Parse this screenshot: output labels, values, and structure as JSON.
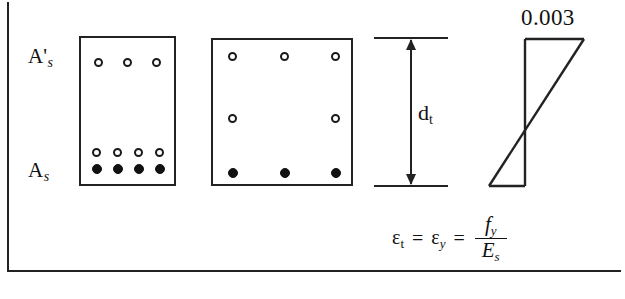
{
  "figure": {
    "labels": {
      "compression_steel": "A",
      "compression_steel_prime": "'",
      "compression_steel_sub": "s",
      "tension_steel": "A",
      "tension_steel_sub": "s",
      "depth_symbol": "d",
      "depth_sub": "t",
      "strain_max": "0.003"
    },
    "equation": {
      "eps_symbol": "ε",
      "eps_t_sub": "t",
      "equals_1": "=",
      "eps_y_sub": "y",
      "equals_2": "=",
      "numerator": "f",
      "numerator_sub": "y",
      "denominator": "E",
      "denominator_sub": "s"
    },
    "colors": {
      "line": "#222222",
      "bar_fill": "#111111",
      "background": "#ffffff"
    },
    "sections": [
      {
        "name": "section-left",
        "rows": [
          {
            "type": "open",
            "count": 3
          },
          {
            "type": "open",
            "count": 4
          },
          {
            "type": "filled",
            "count": 4
          }
        ]
      },
      {
        "name": "section-right",
        "rows": [
          {
            "type": "open",
            "count": 3
          },
          {
            "type": "open",
            "count": 2
          },
          {
            "type": "filled",
            "count": 3
          }
        ]
      }
    ],
    "strain_diagram": {
      "top_strain": "0.003",
      "shape": "bowtie",
      "neutral_axis_fraction": 0.635
    }
  }
}
